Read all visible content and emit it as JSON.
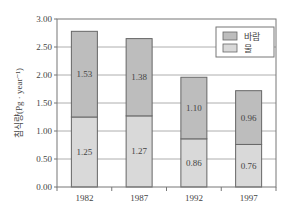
{
  "chart_data": {
    "type": "bar",
    "stacked": true,
    "title": "",
    "xlabel": "",
    "ylabel": "침식량(Pg · year⁻¹)",
    "ylim": [
      0,
      3.0
    ],
    "yticks": [
      "0.00",
      "0.50",
      "1.00",
      "1.50",
      "2.00",
      "2.50",
      "3.00"
    ],
    "grid": true,
    "legend_position": "upper right",
    "categories": [
      "1982",
      "1987",
      "1992",
      "1997"
    ],
    "series": [
      {
        "name": "물",
        "color": "#d9d9d9",
        "values": [
          1.25,
          1.27,
          0.86,
          0.76
        ],
        "labels": [
          "1.25",
          "1.27",
          "0.86",
          "0.76"
        ]
      },
      {
        "name": "바람",
        "color": "#bdbdbd",
        "values": [
          1.53,
          1.38,
          1.1,
          0.96
        ],
        "labels": [
          "1.53",
          "1.38",
          "1.10",
          "0.96"
        ]
      }
    ],
    "legend": [
      {
        "label": "바람",
        "color": "#bdbdbd"
      },
      {
        "label": "물",
        "color": "#d9d9d9"
      }
    ]
  },
  "layout": {
    "plot_left": 57,
    "plot_right": 276,
    "plot_top": 19,
    "plot_bottom": 187,
    "frame_color": "#777777",
    "grid_color": "#999999"
  }
}
